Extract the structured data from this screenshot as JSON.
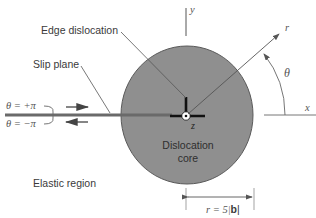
{
  "diagram": {
    "labels": {
      "edge_dislocation": "Edge dislocation",
      "slip_plane": "Slip plane",
      "theta_plus": "θ = +π",
      "theta_minus": "θ = −π",
      "elastic_region": "Elastic region",
      "core_line1": "Dislocation",
      "core_line2": "core",
      "axis_x": "x",
      "axis_y": "y",
      "axis_z": "z",
      "radius": "r",
      "angle": "θ",
      "core_radius_prefix": "r = 5|",
      "core_radius_bold": "b",
      "core_radius_suffix": "|"
    },
    "colors": {
      "core_fill": "#8f8f8f",
      "core_stroke": "#5a5a5a",
      "slip_plane": "#6a6a6a",
      "line": "#555555",
      "dislocation_symbol": "#111111"
    }
  }
}
